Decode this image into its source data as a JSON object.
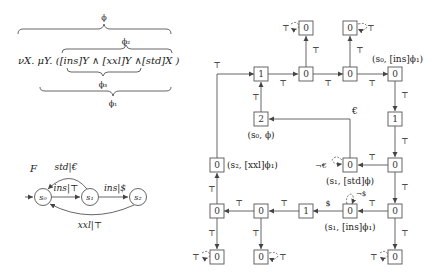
{
  "formula": {
    "prefix": "νX. μY. (",
    "part_ins": "[ins]Y",
    "and1": " ∧ ",
    "part_xxl": "[xxl]Y",
    "and2": " ∧",
    "part_std": "[std]X",
    "suffix": " )",
    "braces": {
      "phi": "ϕ",
      "phi2": "ϕ₂",
      "phi3": "ϕ₃",
      "phi1": "ϕ₁"
    }
  },
  "automaton": {
    "name": "F",
    "states": [
      {
        "id": "s0",
        "label": "s₀",
        "initial": true
      },
      {
        "id": "s1",
        "label": "s₁"
      },
      {
        "id": "s2",
        "label": "s₂"
      }
    ],
    "transitions": [
      {
        "from": "s0",
        "to": "s1",
        "label": "ins|⊤"
      },
      {
        "from": "s1",
        "to": "s2",
        "label": "ins|$"
      },
      {
        "from": "s1",
        "to": "s0",
        "label": "std|€"
      },
      {
        "from": "s2",
        "to": "s0",
        "label": "xxl|⊤"
      }
    ]
  },
  "game_graph": {
    "top_symbol": "⊤",
    "nodes": [
      {
        "id": "n1",
        "value": "1"
      },
      {
        "id": "n2",
        "value": "0"
      },
      {
        "id": "n3",
        "value": "0"
      },
      {
        "id": "n4",
        "value": "0",
        "annotation": "(s₀, [ins]ϕ₁)"
      },
      {
        "id": "top1",
        "value": "0"
      },
      {
        "id": "top2",
        "value": "0"
      },
      {
        "id": "r1",
        "value": "1"
      },
      {
        "id": "r2",
        "value": "0"
      },
      {
        "id": "mid2",
        "value": "2",
        "annotation": "(s₀, ϕ)"
      },
      {
        "id": "std",
        "value": "0",
        "annotation": "(s₁, [std]ϕ)"
      },
      {
        "id": "left",
        "value": "0",
        "annotation": "(s₂, [xxl]ϕ₁)"
      },
      {
        "id": "ins1",
        "value": "0",
        "annotation": "(s₁, [ins]ϕ₁)"
      },
      {
        "id": "r3",
        "value": "0"
      },
      {
        "id": "b1",
        "value": "0"
      },
      {
        "id": "b2",
        "value": "0"
      },
      {
        "id": "b3",
        "value": "1"
      },
      {
        "id": "bb1",
        "value": "0"
      },
      {
        "id": "bb2",
        "value": "0"
      },
      {
        "id": "bb3",
        "value": "0"
      }
    ],
    "edge_labels": {
      "top": "⊤",
      "euro": "€",
      "not_euro": "¬€",
      "dollar": "$",
      "not_dollar": "¬$"
    }
  }
}
